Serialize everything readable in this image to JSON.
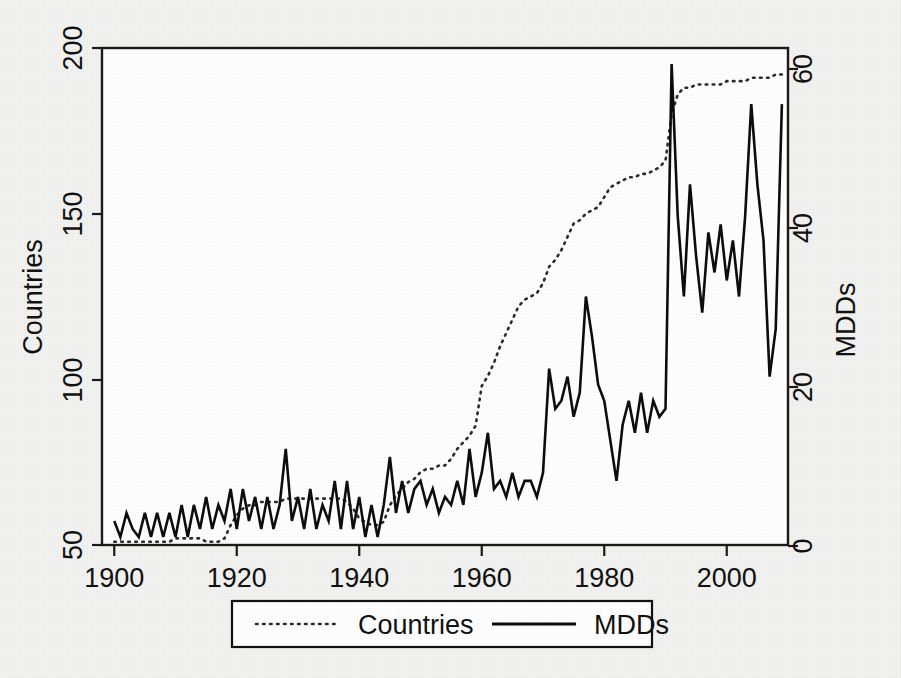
{
  "chart_data": {
    "type": "line",
    "title": "",
    "xlabel": "",
    "ylabel": "Countries",
    "y2label": "MDDs",
    "xlim": [
      1898,
      2010
    ],
    "ylim": [
      50,
      200
    ],
    "y2lim": [
      0,
      62
    ],
    "grid": false,
    "legend_position": "bottom-center",
    "xticks": [
      1900,
      1920,
      1940,
      1960,
      1980,
      2000
    ],
    "yticks": [
      50,
      100,
      150,
      200
    ],
    "y2ticks": [
      0,
      20,
      40,
      60
    ],
    "series": [
      {
        "name": "Countries",
        "axis": "left",
        "style": "dotted",
        "color": "#2b2b2b",
        "x": [
          1900,
          1901,
          1902,
          1903,
          1904,
          1905,
          1906,
          1907,
          1908,
          1909,
          1910,
          1911,
          1912,
          1913,
          1914,
          1915,
          1916,
          1917,
          1918,
          1919,
          1920,
          1921,
          1922,
          1923,
          1924,
          1925,
          1926,
          1927,
          1928,
          1929,
          1930,
          1931,
          1932,
          1933,
          1934,
          1935,
          1936,
          1937,
          1938,
          1939,
          1940,
          1941,
          1942,
          1943,
          1944,
          1945,
          1946,
          1947,
          1948,
          1949,
          1950,
          1951,
          1952,
          1953,
          1954,
          1955,
          1956,
          1957,
          1958,
          1959,
          1960,
          1961,
          1962,
          1963,
          1964,
          1965,
          1966,
          1967,
          1968,
          1969,
          1970,
          1971,
          1972,
          1973,
          1974,
          1975,
          1976,
          1977,
          1978,
          1979,
          1980,
          1981,
          1982,
          1983,
          1984,
          1985,
          1986,
          1987,
          1988,
          1989,
          1990,
          1991,
          1992,
          1993,
          1994,
          1995,
          1996,
          1997,
          1998,
          1999,
          2000,
          2001,
          2002,
          2003,
          2004,
          2005,
          2006,
          2007,
          2008,
          2009
        ],
        "values": [
          51,
          51,
          51,
          51,
          51,
          51,
          51,
          51,
          51,
          51,
          52,
          52,
          52,
          52,
          52,
          51,
          51,
          51,
          52,
          56,
          59,
          61,
          62,
          62,
          63,
          63,
          63,
          63,
          64,
          64,
          64,
          64,
          64,
          64,
          64,
          64,
          64,
          64,
          63,
          61,
          58,
          57,
          56,
          56,
          57,
          62,
          65,
          67,
          69,
          70,
          72,
          73,
          73,
          74,
          74,
          76,
          79,
          81,
          83,
          86,
          98,
          101,
          105,
          110,
          114,
          118,
          122,
          124,
          125,
          126,
          129,
          134,
          136,
          139,
          143,
          147,
          148,
          150,
          151,
          152,
          155,
          158,
          159,
          160,
          161,
          161,
          162,
          162,
          163,
          164,
          166,
          180,
          186,
          188,
          188,
          189,
          189,
          189,
          189,
          189,
          190,
          190,
          190,
          190,
          191,
          191,
          191,
          191,
          192,
          192
        ]
      },
      {
        "name": "MDDs",
        "axis": "right",
        "style": "solid",
        "color": "#0d0d0d",
        "x": [
          1900,
          1901,
          1902,
          1903,
          1904,
          1905,
          1906,
          1907,
          1908,
          1909,
          1910,
          1911,
          1912,
          1913,
          1914,
          1915,
          1916,
          1917,
          1918,
          1919,
          1920,
          1921,
          1922,
          1923,
          1924,
          1925,
          1926,
          1927,
          1928,
          1929,
          1930,
          1931,
          1932,
          1933,
          1934,
          1935,
          1936,
          1937,
          1938,
          1939,
          1940,
          1941,
          1942,
          1943,
          1944,
          1945,
          1946,
          1947,
          1948,
          1949,
          1950,
          1951,
          1952,
          1953,
          1954,
          1955,
          1956,
          1957,
          1958,
          1959,
          1960,
          1961,
          1962,
          1963,
          1964,
          1965,
          1966,
          1967,
          1968,
          1969,
          1970,
          1971,
          1972,
          1973,
          1974,
          1975,
          1976,
          1977,
          1978,
          1979,
          1980,
          1981,
          1982,
          1983,
          1984,
          1985,
          1986,
          1987,
          1988,
          1989,
          1990,
          1991,
          1992,
          1993,
          1994,
          1995,
          1996,
          1997,
          1998,
          1999,
          2000,
          2001,
          2002,
          2003,
          2004,
          2005,
          2006,
          2007,
          2008,
          2009
        ],
        "values": [
          3,
          1,
          4,
          2,
          1,
          4,
          1,
          4,
          1,
          4,
          1,
          5,
          1,
          5,
          2,
          6,
          2,
          5,
          3,
          7,
          2,
          7,
          3,
          6,
          2,
          6,
          2,
          5,
          12,
          3,
          6,
          2,
          7,
          2,
          5,
          3,
          8,
          2,
          8,
          2,
          6,
          1,
          5,
          1,
          5,
          11,
          4,
          8,
          4,
          7,
          8,
          5,
          7,
          4,
          6,
          5,
          8,
          5,
          12,
          6,
          9,
          14,
          7,
          8,
          6,
          9,
          6,
          8,
          8,
          6,
          9,
          22,
          17,
          18,
          21,
          16,
          19,
          31,
          26,
          20,
          18,
          13,
          8,
          15,
          18,
          14,
          19,
          14,
          18,
          16,
          17,
          60,
          41,
          31,
          45,
          36,
          29,
          39,
          34,
          40,
          33,
          38,
          31,
          41,
          55,
          45,
          38,
          21,
          27,
          55
        ]
      }
    ],
    "legend": [
      {
        "label": "Countries",
        "style": "dotted"
      },
      {
        "label": "MDDs",
        "style": "solid"
      }
    ]
  },
  "axes": {
    "left": {
      "title": "Countries",
      "ticks": [
        "50",
        "100",
        "150",
        "200"
      ]
    },
    "right": {
      "title": "MDDs",
      "ticks": [
        "0",
        "20",
        "40",
        "60"
      ]
    },
    "bottom": {
      "ticks": [
        "1900",
        "1920",
        "1940",
        "1960",
        "1980",
        "2000"
      ]
    }
  },
  "legend": {
    "countries_label": "Countries",
    "mdds_label": "MDDs"
  },
  "colors": {
    "page_background": "#f2f2f0",
    "plot_background": "#ffffff",
    "axis": "#1a1a1a",
    "countries_line": "#2b2b2b",
    "mdds_line": "#0d0d0d"
  }
}
